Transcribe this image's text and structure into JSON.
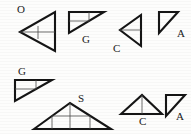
{
  "figure": {
    "caption": "",
    "background_color": "#fdfdfc",
    "stroke_color": "#151515",
    "inner_line_color": "#3a3a3a",
    "rows": 2,
    "shape_count": 8
  },
  "shapes": [
    {
      "id": "shape-1",
      "label": "O",
      "row": 1,
      "position": 1,
      "orientation": "pointing-left",
      "type": "triangle",
      "inner_lines": "horizontal-median-and-short-vertical"
    },
    {
      "id": "shape-2",
      "label": "G",
      "row": 1,
      "position": 2,
      "orientation": "right-angle-top-left",
      "type": "right-triangle",
      "inner_lines": "cevian-and-vertical"
    },
    {
      "id": "shape-3",
      "label": "C",
      "row": 1,
      "position": 3,
      "orientation": "pointing-left",
      "type": "triangle",
      "inner_lines": "horizontal-median"
    },
    {
      "id": "shape-4",
      "label": "A",
      "row": 1,
      "position": 4,
      "orientation": "right-angle-top-left",
      "type": "right-triangle",
      "inner_lines": "none"
    },
    {
      "id": "shape-5",
      "label": "G",
      "row": 2,
      "position": 1,
      "orientation": "right-angle-top-left",
      "type": "right-triangle",
      "inner_lines": "cevian-and-vertical"
    },
    {
      "id": "shape-6",
      "label": "S",
      "row": 2,
      "position": 2,
      "orientation": "apex-up-wide",
      "type": "triangle",
      "inner_lines": "three-verticals"
    },
    {
      "id": "shape-7",
      "label": "C",
      "row": 2,
      "position": 3,
      "orientation": "apex-up",
      "type": "triangle",
      "inner_lines": "vertical-median"
    },
    {
      "id": "shape-8",
      "label": "A",
      "row": 2,
      "position": 4,
      "orientation": "right-angle-top-left",
      "type": "right-triangle",
      "inner_lines": "none"
    }
  ],
  "labels": {
    "s1": {
      "text": "O",
      "x": 17,
      "y": 6
    },
    "s2": {
      "text": "G",
      "x": 82,
      "y": 36
    },
    "s3": {
      "text": "C",
      "x": 113,
      "y": 43
    },
    "s4": {
      "text": "A",
      "x": 177,
      "y": 29
    },
    "s5": {
      "text": "G",
      "x": 18,
      "y": 68
    },
    "s6": {
      "text": "S",
      "x": 78,
      "y": 95
    },
    "s7": {
      "text": "C",
      "x": 139,
      "y": 119
    },
    "s8": {
      "text": "A",
      "x": 175,
      "y": 112
    }
  }
}
